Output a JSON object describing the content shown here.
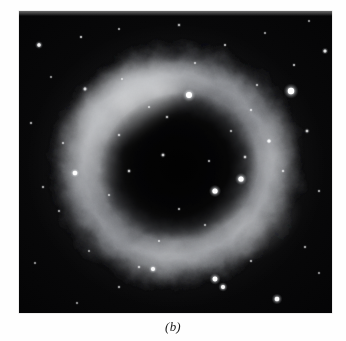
{
  "figure": {
    "caption": "(b)",
    "kind": "astronomical-photograph",
    "photo": {
      "x": 19,
      "y": 11,
      "width": 313,
      "height": 302,
      "background_color": "#050506",
      "page_background_color": "#ffffff"
    }
  },
  "chart_data": {
    "type": "scatter",
    "title": "(b)",
    "xlabel": "",
    "ylabel": "",
    "grid": false,
    "legend": null,
    "xlim": [
      0,
      313
    ],
    "ylim": [
      0,
      302
    ],
    "nebula": {
      "center_x": 157,
      "center_y": 155,
      "outer_radius_x": 133,
      "outer_radius_y": 128,
      "inner_radius_x": 78,
      "inner_radius_y": 72,
      "rotation_deg": -18,
      "ring_color": "#b9bcc0",
      "ring_peak_color": "#d8dadd",
      "core_color": "#0a0a0c",
      "bright_arc_start_deg": 185,
      "bright_arc_end_deg": 330
    },
    "stars": [
      {
        "x": 20,
        "y": 34,
        "r": 1.7,
        "b": 0.85
      },
      {
        "x": 62,
        "y": 26,
        "r": 1.0,
        "b": 0.55
      },
      {
        "x": 100,
        "y": 18,
        "r": 0.9,
        "b": 0.45
      },
      {
        "x": 160,
        "y": 14,
        "r": 1.1,
        "b": 0.5
      },
      {
        "x": 176,
        "y": 52,
        "r": 1.0,
        "b": 0.45
      },
      {
        "x": 206,
        "y": 34,
        "r": 1.0,
        "b": 0.5
      },
      {
        "x": 246,
        "y": 22,
        "r": 0.9,
        "b": 0.42
      },
      {
        "x": 275,
        "y": 54,
        "r": 1.0,
        "b": 0.5
      },
      {
        "x": 290,
        "y": 10,
        "r": 0.9,
        "b": 0.4
      },
      {
        "x": 306,
        "y": 40,
        "r": 1.5,
        "b": 0.72
      },
      {
        "x": 272,
        "y": 80,
        "r": 3.2,
        "b": 1.0
      },
      {
        "x": 238,
        "y": 74,
        "r": 1.0,
        "b": 0.45
      },
      {
        "x": 232,
        "y": 99,
        "r": 1.1,
        "b": 0.5
      },
      {
        "x": 212,
        "y": 120,
        "r": 1.0,
        "b": 0.45
      },
      {
        "x": 170,
        "y": 84,
        "r": 3.0,
        "b": 1.0
      },
      {
        "x": 130,
        "y": 96,
        "r": 1.0,
        "b": 0.45
      },
      {
        "x": 103,
        "y": 68,
        "r": 1.0,
        "b": 0.42
      },
      {
        "x": 66,
        "y": 78,
        "r": 1.4,
        "b": 0.62
      },
      {
        "x": 32,
        "y": 66,
        "r": 0.9,
        "b": 0.4
      },
      {
        "x": 12,
        "y": 112,
        "r": 1.0,
        "b": 0.45
      },
      {
        "x": 44,
        "y": 132,
        "r": 1.0,
        "b": 0.45
      },
      {
        "x": 56,
        "y": 162,
        "r": 2.3,
        "b": 0.92
      },
      {
        "x": 24,
        "y": 176,
        "r": 1.0,
        "b": 0.45
      },
      {
        "x": 40,
        "y": 200,
        "r": 1.0,
        "b": 0.42
      },
      {
        "x": 90,
        "y": 184,
        "r": 1.0,
        "b": 0.45
      },
      {
        "x": 110,
        "y": 160,
        "r": 1.2,
        "b": 0.55
      },
      {
        "x": 144,
        "y": 144,
        "r": 1.3,
        "b": 0.6
      },
      {
        "x": 100,
        "y": 124,
        "r": 1.1,
        "b": 0.5
      },
      {
        "x": 148,
        "y": 106,
        "r": 1.1,
        "b": 0.5
      },
      {
        "x": 190,
        "y": 150,
        "r": 1.0,
        "b": 0.45
      },
      {
        "x": 196,
        "y": 180,
        "r": 2.6,
        "b": 0.97
      },
      {
        "x": 222,
        "y": 168,
        "r": 2.6,
        "b": 0.97
      },
      {
        "x": 226,
        "y": 146,
        "r": 1.2,
        "b": 0.55
      },
      {
        "x": 250,
        "y": 130,
        "r": 1.6,
        "b": 0.75
      },
      {
        "x": 264,
        "y": 160,
        "r": 1.1,
        "b": 0.5
      },
      {
        "x": 288,
        "y": 120,
        "r": 1.3,
        "b": 0.58
      },
      {
        "x": 300,
        "y": 180,
        "r": 1.0,
        "b": 0.45
      },
      {
        "x": 160,
        "y": 198,
        "r": 1.0,
        "b": 0.45
      },
      {
        "x": 140,
        "y": 230,
        "r": 1.0,
        "b": 0.45
      },
      {
        "x": 186,
        "y": 214,
        "r": 1.0,
        "b": 0.42
      },
      {
        "x": 120,
        "y": 256,
        "r": 1.1,
        "b": 0.5
      },
      {
        "x": 70,
        "y": 240,
        "r": 0.9,
        "b": 0.4
      },
      {
        "x": 100,
        "y": 276,
        "r": 1.0,
        "b": 0.45
      },
      {
        "x": 134,
        "y": 258,
        "r": 2.0,
        "b": 0.85
      },
      {
        "x": 196,
        "y": 268,
        "r": 2.4,
        "b": 0.95
      },
      {
        "x": 204,
        "y": 276,
        "r": 2.0,
        "b": 0.88
      },
      {
        "x": 258,
        "y": 288,
        "r": 2.3,
        "b": 0.92
      },
      {
        "x": 232,
        "y": 250,
        "r": 1.0,
        "b": 0.45
      },
      {
        "x": 286,
        "y": 236,
        "r": 1.0,
        "b": 0.45
      },
      {
        "x": 300,
        "y": 262,
        "r": 0.9,
        "b": 0.4
      },
      {
        "x": 58,
        "y": 292,
        "r": 0.9,
        "b": 0.4
      },
      {
        "x": 16,
        "y": 252,
        "r": 0.9,
        "b": 0.4
      }
    ]
  }
}
